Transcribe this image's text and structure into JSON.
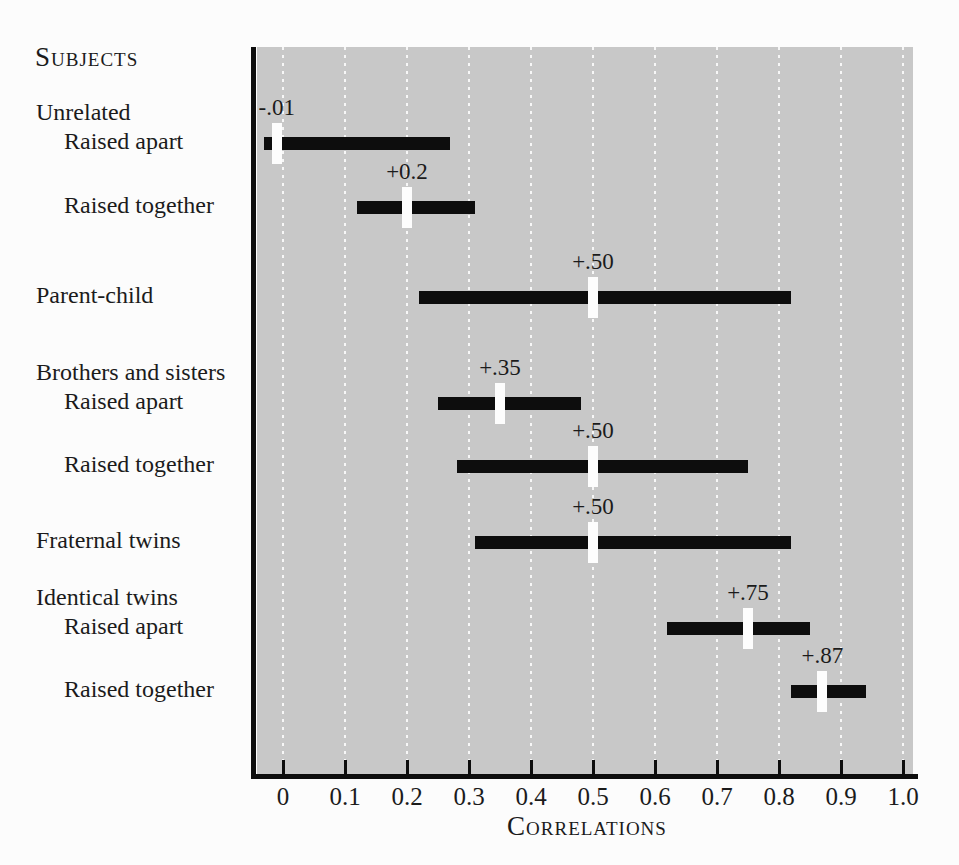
{
  "header": "Subjects",
  "colors": {
    "page_bg": "#fcfcfc",
    "plot_bg": "#c8c8c8",
    "bar": "#0d0d0d",
    "marker": "#fdfdfd",
    "gridline": "#ffffff",
    "text": "#1b1b1b"
  },
  "chart_data": {
    "type": "bar",
    "subtype": "horizontal-floating-range-bars-with-median-markers",
    "title": "Subjects",
    "xlabel": "Correlations",
    "ylabel": "",
    "xlim": [
      0,
      1.0
    ],
    "x_ticks": [
      "0",
      "0.1",
      "0.2",
      "0.3",
      "0.4",
      "0.5",
      "0.6",
      "0.7",
      "0.8",
      "0.9",
      "1.0"
    ],
    "grid": "vertical white dotted lines at each 0.1",
    "legend": "none",
    "rows": [
      {
        "group": "Unrelated",
        "label": "Raised apart",
        "low": -0.03,
        "high": 0.27,
        "median": -0.01,
        "median_label": "-.01"
      },
      {
        "group": "Unrelated",
        "label": "Raised together",
        "low": 0.12,
        "high": 0.31,
        "median": 0.2,
        "median_label": "+0.2"
      },
      {
        "group": null,
        "label": "Parent-child",
        "low": 0.22,
        "high": 0.82,
        "median": 0.5,
        "median_label": "+.50"
      },
      {
        "group": "Brothers and sisters",
        "label": "Raised apart",
        "low": 0.25,
        "high": 0.48,
        "median": 0.35,
        "median_label": "+.35"
      },
      {
        "group": "Brothers and sisters",
        "label": "Raised together",
        "low": 0.28,
        "high": 0.75,
        "median": 0.5,
        "median_label": "+.50"
      },
      {
        "group": null,
        "label": "Fraternal twins",
        "low": 0.31,
        "high": 0.82,
        "median": 0.5,
        "median_label": "+.50"
      },
      {
        "group": "Identical twins",
        "label": "Raised apart",
        "low": 0.62,
        "high": 0.85,
        "median": 0.75,
        "median_label": "+.75"
      },
      {
        "group": "Identical twins",
        "label": "Raised together",
        "low": 0.82,
        "high": 0.94,
        "median": 0.87,
        "median_label": "+.87"
      }
    ]
  }
}
